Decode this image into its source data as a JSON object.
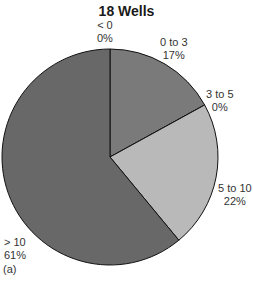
{
  "chart_data": {
    "type": "pie",
    "title": "18 Wells",
    "panel_label": "(a)",
    "categories": [
      "< 0",
      "0 to 3",
      "3 to 5",
      "5 to 10",
      "> 10"
    ],
    "values": [
      0,
      17,
      0,
      22,
      61
    ],
    "value_labels": [
      "0%",
      "17%",
      "0%",
      "22%",
      "61%"
    ],
    "colors": [
      "#6e6e6e",
      "#7a7a7a",
      "#9a9a9a",
      "#b9b9b9",
      "#686868"
    ],
    "start_angle": "12 o'clock, clockwise",
    "legend": "none (inline labels)"
  },
  "labels": {
    "lt0": {
      "name": "< 0",
      "pct": "0%"
    },
    "z3": {
      "name": "0 to 3",
      "pct": "17%"
    },
    "t35": {
      "name": "3 to 5",
      "pct": "0%"
    },
    "t510": {
      "name": "5 to 10",
      "pct": "22%"
    },
    "gt10": {
      "name": "> 10",
      "pct": "61%"
    }
  }
}
